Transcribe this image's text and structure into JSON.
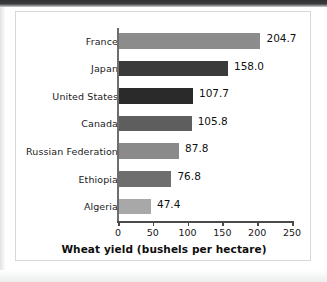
{
  "chart_data": {
    "type": "bar",
    "orientation": "horizontal",
    "title": "",
    "xlabel": "Wheat yield (bushels per hectare)",
    "ylabel": "",
    "xlim": [
      0,
      250
    ],
    "xticks": [
      0,
      50,
      100,
      150,
      200,
      250
    ],
    "grid": false,
    "legend": "none",
    "categories": [
      "France",
      "Japan",
      "United States",
      "Canada",
      "Russian Federation",
      "Ethiopia",
      "Algeria"
    ],
    "values": [
      204.7,
      158.0,
      107.7,
      105.8,
      87.8,
      76.8,
      47.4
    ],
    "value_labels": [
      "204.7",
      "158.0",
      "107.7",
      "105.8",
      "87.8",
      "76.8",
      "47.4"
    ],
    "bar_colors": [
      "#8c8c8c",
      "#3a3a3a",
      "#2a2a2a",
      "#5e5e5e",
      "#8a8a8a",
      "#6e6e6e",
      "#a8a8a8"
    ]
  },
  "axis": {
    "tick_labels": [
      "0",
      "50",
      "100",
      "150",
      "200",
      "250"
    ],
    "title": "Wheat yield (bushels per hectare)"
  }
}
